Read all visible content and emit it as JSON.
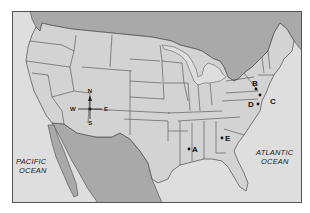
{
  "map": {
    "title": "United States map with labeled points",
    "colors": {
      "land_us": "#d3d3d3",
      "land_foreign": "#a9a9a9",
      "water": "#dedede",
      "border": "#4a4a4a",
      "frame": "#555555"
    },
    "compass": {
      "north": "N",
      "south": "S",
      "east": "E",
      "west": "W"
    },
    "oceans": {
      "pacific_line1": "PACIFIC",
      "pacific_line2": "OCEAN",
      "atlantic_line1": "ATLANTIC",
      "atlantic_line2": "OCEAN"
    },
    "points": [
      {
        "label": "A",
        "location": "Mississippi"
      },
      {
        "label": "B",
        "location": "Pennsylvania"
      },
      {
        "label": "C",
        "location": "New Jersey / Delaware coast"
      },
      {
        "label": "D",
        "location": "Virginia / Maryland"
      },
      {
        "label": "E",
        "location": "Georgia"
      }
    ]
  }
}
